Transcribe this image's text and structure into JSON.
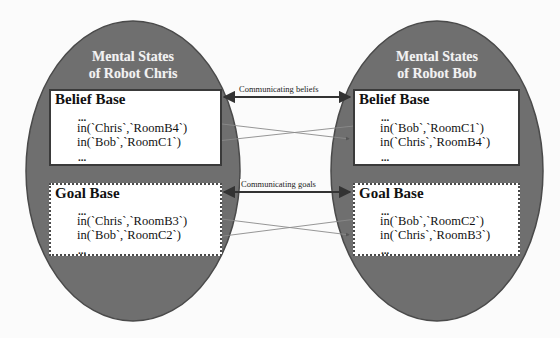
{
  "diagram": {
    "robots": [
      {
        "id": "chris",
        "title_line1": "Mental States",
        "title_line2": "of Robot Chris",
        "belief_base": {
          "title": "Belief Base",
          "dots_top": "...",
          "facts": [
            "in(`Chris`,`RoomB4`)",
            "in(`Bob`,`RoomC1`)"
          ],
          "dots_bottom": "..."
        },
        "goal_base": {
          "title": "Goal Base",
          "dots_top": "...",
          "facts": [
            "in(`Chris`,`RoomB3`)",
            "in(`Bob`,`RoomC2`)"
          ],
          "dots_bottom": "..."
        }
      },
      {
        "id": "bob",
        "title_line1": "Mental States",
        "title_line2": "of Robot Bob",
        "belief_base": {
          "title": "Belief Base",
          "dots_top": "...",
          "facts": [
            "in(`Bob`,`RoomC1`)",
            "in(`Chris`,`RoomB4`)"
          ],
          "dots_bottom": "..."
        },
        "goal_base": {
          "title": "Goal Base",
          "dots_top": "...",
          "facts": [
            "in(`Bob`,`RoomC2`)",
            "in(`Chris`,`RoomB3`)"
          ],
          "dots_bottom": "..."
        }
      }
    ],
    "connections": {
      "beliefs_label": "Communicating beliefs",
      "goals_label": "Communicating goals"
    },
    "colors": {
      "ellipse_fill": "#6f6f6f",
      "ellipse_stroke": "#4a4a4a",
      "box_fill": "#ffffff",
      "arrow": "#333333",
      "cross_arrow": "#8a8a8a"
    }
  }
}
